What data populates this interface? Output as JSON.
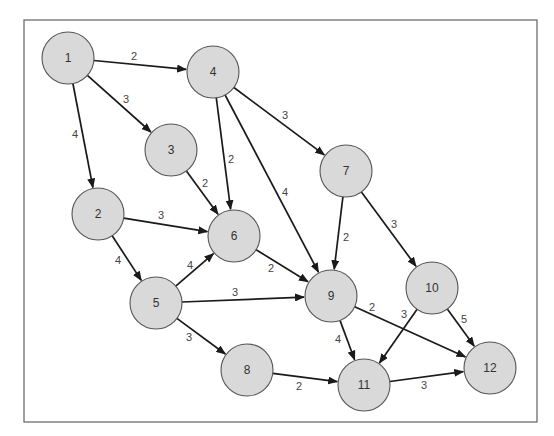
{
  "diagram": {
    "type": "directed-weighted-network",
    "frame": {
      "x": 24,
      "y": 20,
      "width": 513,
      "height": 402
    },
    "colors": {
      "node_fill": "#d9d9d9",
      "node_stroke": "#555555",
      "edge": "#1a1a1a",
      "label": "#444444"
    },
    "node_radius": 26,
    "nodes": [
      {
        "id": "1",
        "label": "1",
        "x": 68,
        "y": 58
      },
      {
        "id": "2",
        "label": "2",
        "x": 98,
        "y": 214
      },
      {
        "id": "3",
        "label": "3",
        "x": 171,
        "y": 150
      },
      {
        "id": "4",
        "label": "4",
        "x": 213,
        "y": 72
      },
      {
        "id": "5",
        "label": "5",
        "x": 156,
        "y": 303
      },
      {
        "id": "6",
        "label": "6",
        "x": 234,
        "y": 236
      },
      {
        "id": "7",
        "label": "7",
        "x": 346,
        "y": 171
      },
      {
        "id": "8",
        "label": "8",
        "x": 247,
        "y": 370
      },
      {
        "id": "9",
        "label": "9",
        "x": 331,
        "y": 296
      },
      {
        "id": "10",
        "label": "10",
        "x": 432,
        "y": 288
      },
      {
        "id": "11",
        "label": "11",
        "x": 364,
        "y": 385
      },
      {
        "id": "12",
        "label": "12",
        "x": 490,
        "y": 368
      }
    ],
    "edges": [
      {
        "from": "1",
        "to": "4",
        "weight": "2",
        "lx": 134,
        "ly": 56
      },
      {
        "from": "1",
        "to": "3",
        "weight": "3",
        "lx": 126,
        "ly": 99
      },
      {
        "from": "1",
        "to": "2",
        "weight": "4",
        "lx": 75,
        "ly": 134
      },
      {
        "from": "4",
        "to": "6",
        "weight": "2",
        "lx": 231,
        "ly": 159
      },
      {
        "from": "4",
        "to": "9",
        "weight": "4",
        "lx": 285,
        "ly": 192
      },
      {
        "from": "4",
        "to": "7",
        "weight": "3",
        "lx": 285,
        "ly": 115
      },
      {
        "from": "3",
        "to": "6",
        "weight": "2",
        "lx": 205,
        "ly": 183
      },
      {
        "from": "2",
        "to": "6",
        "weight": "3",
        "lx": 161,
        "ly": 215
      },
      {
        "from": "2",
        "to": "5",
        "weight": "4",
        "lx": 118,
        "ly": 260
      },
      {
        "from": "5",
        "to": "6",
        "weight": "4",
        "lx": 190,
        "ly": 265
      },
      {
        "from": "5",
        "to": "9",
        "weight": "3",
        "lx": 235,
        "ly": 292
      },
      {
        "from": "5",
        "to": "8",
        "weight": "3",
        "lx": 189,
        "ly": 337
      },
      {
        "from": "6",
        "to": "9",
        "weight": "2",
        "lx": 271,
        "ly": 268
      },
      {
        "from": "7",
        "to": "9",
        "weight": "2",
        "lx": 346,
        "ly": 237
      },
      {
        "from": "7",
        "to": "10",
        "weight": "3",
        "lx": 394,
        "ly": 224
      },
      {
        "from": "9",
        "to": "11",
        "weight": "4",
        "lx": 338,
        "ly": 339
      },
      {
        "from": "9",
        "to": "12",
        "weight": "2",
        "lx": 372,
        "ly": 307
      },
      {
        "from": "10",
        "to": "11",
        "weight": "3",
        "lx": 404,
        "ly": 314
      },
      {
        "from": "10",
        "to": "12",
        "weight": "5",
        "lx": 464,
        "ly": 319
      },
      {
        "from": "8",
        "to": "11",
        "weight": "2",
        "lx": 299,
        "ly": 386
      },
      {
        "from": "11",
        "to": "12",
        "weight": "3",
        "lx": 424,
        "ly": 385
      }
    ]
  }
}
